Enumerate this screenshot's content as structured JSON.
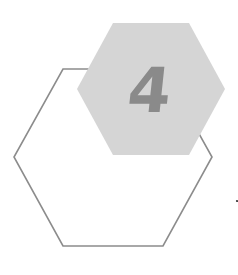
{
  "graphic": {
    "number": "4",
    "colors": {
      "filled_hexagon": "#d5d5d5",
      "outline_hexagon": "#8c8c8c",
      "number": "#8a8a8a",
      "dot": "#333333",
      "background": "#ffffff"
    }
  }
}
